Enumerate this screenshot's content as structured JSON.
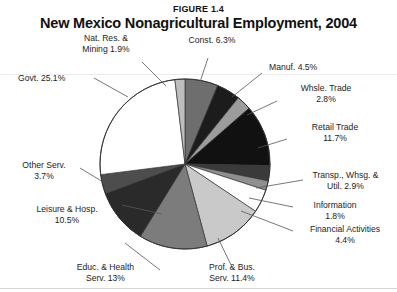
{
  "figure": {
    "number": "FIGURE 1.4",
    "title": "New Mexico Nonagricultural Employment, 2004"
  },
  "chart_data": {
    "type": "pie",
    "title": "New Mexico Nonagricultural Employment, 2004",
    "subtitle": "FIGURE 1.4",
    "xlabel": "",
    "ylabel": "",
    "legend_position": "none",
    "grid": false,
    "units": "percent of total nonagricultural employment",
    "start_angle_deg": 0,
    "direction": "clockwise",
    "categories": [
      "Const.",
      "Manuf.",
      "Whsle.  Trade",
      "Retail Trade",
      "Transp., Whsg. & Util.",
      "Information",
      "Financial Activities",
      "Prof. & Bus. Serv.",
      "Educ. & Health Serv.",
      "Leisure & Hosp.",
      "Other Serv.",
      "Govt.",
      "Nat. Res. & Mining"
    ],
    "values": [
      6.3,
      4.5,
      2.8,
      11.7,
      2.9,
      1.8,
      4.4,
      11.4,
      13,
      10.5,
      3.7,
      25.1,
      1.9
    ],
    "slice_colors": [
      "#6e6e6e",
      "#1c1c1c",
      "#9c9c9c",
      "#111111",
      "#3a3a3a",
      "#8f8f8f",
      "#ffffff",
      "#c9c9c9",
      "#7c7c7c",
      "#2a2a2a",
      "#4d4d4d",
      "#ffffff",
      "#bdbdbd"
    ],
    "annotations": [
      {
        "label": "Nat. Res. &",
        "value": "Mining 1.9%"
      },
      {
        "label": "Const. 6.3%",
        "value": ""
      },
      {
        "label": "Manuf. 4.5%",
        "value": ""
      },
      {
        "label": "Whsle.  Trade",
        "value": "2.8%"
      },
      {
        "label": "Retail Trade",
        "value": "11.7%"
      },
      {
        "label": "Transp.,  Whsg. &",
        "value": "Util.  2.9%"
      },
      {
        "label": "Information",
        "value": "1.8%"
      },
      {
        "label": "Financial Activities",
        "value": "4.4%"
      },
      {
        "label": "Prof. & Bus.",
        "value": "Serv. 11.4%"
      },
      {
        "label": "Educ.  &  Health",
        "value": "Serv.  13%"
      },
      {
        "label": "Leisure & Hosp.",
        "value": "10.5%"
      },
      {
        "label": "Other Serv.",
        "value": "3.7%"
      },
      {
        "label": "Govt. 25.1%",
        "value": ""
      }
    ]
  },
  "labels": {
    "natres_l1": "Nat. Res. &",
    "natres_l2": "Mining 1.9%",
    "const": "Const. 6.3%",
    "manuf": "Manuf. 4.5%",
    "whsle_l1": "Whsle.  Trade",
    "whsle_l2": "2.8%",
    "retail_l1": "Retail Trade",
    "retail_l2": "11.7%",
    "transp_l1": "Transp.,  Whsg. &",
    "transp_l2": "Util.  2.9%",
    "info_l1": "Information",
    "info_l2": "1.8%",
    "fin_l1": "Financial Activities",
    "fin_l2": "4.4%",
    "prof_l1": "Prof. & Bus.",
    "prof_l2": "Serv. 11.4%",
    "educ_l1": "Educ.  &  Health",
    "educ_l2": "Serv.  13%",
    "leisure_l1": "Leisure & Hosp.",
    "leisure_l2": "10.5%",
    "other_l1": "Other Serv.",
    "other_l2": "3.7%",
    "govt": "Govt. 25.1%"
  },
  "style": {
    "outline_color": "#333333",
    "leader_color": "#555555",
    "background": "#ffffff"
  }
}
